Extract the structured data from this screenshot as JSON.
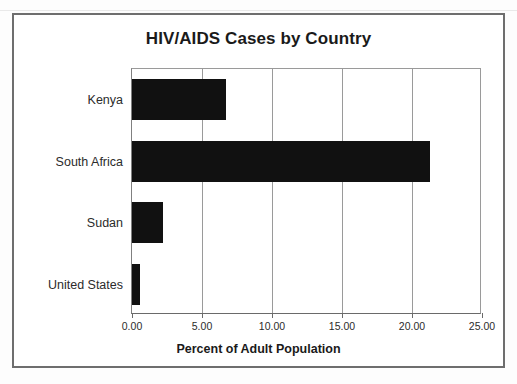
{
  "chart_data": {
    "type": "bar",
    "orientation": "horizontal",
    "title": "HIV/AIDS Cases by Country",
    "xlabel": "Percent of Adult Population",
    "ylabel": "",
    "categories": [
      "Kenya",
      "South Africa",
      "Sudan",
      "United States"
    ],
    "values": [
      6.7,
      21.3,
      2.2,
      0.6
    ],
    "xlim": [
      0,
      25
    ],
    "xticks": [
      0,
      5,
      10,
      15,
      20,
      25
    ],
    "xtick_labels": [
      "0.00",
      "5.00",
      "10.00",
      "15.00",
      "20.00",
      "25.00"
    ],
    "grid": "vertical",
    "legend": "none",
    "bar_color": "#111111",
    "gridline_color": "#9a9a9a",
    "frame_color": "#6e6e6e"
  },
  "figure": {
    "title": "HIV/AIDS Cases by Country",
    "x_axis_title": "Percent of Adult Population"
  }
}
